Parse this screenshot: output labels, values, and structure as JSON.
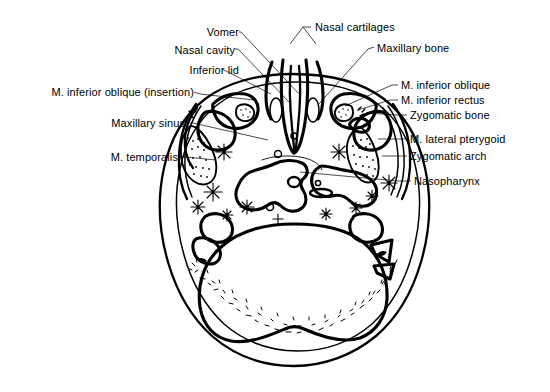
{
  "figure": {
    "background_color": "#ffffff",
    "line_color": "#000000",
    "width": 550,
    "height": 392
  },
  "labels": {
    "left": [
      {
        "id": "inferior-lid",
        "text": "Inferior lid"
      },
      {
        "id": "m-inferior-oblique-insertion",
        "text": "M. inferior oblique (insertion)"
      },
      {
        "id": "maxillary-sinus",
        "text": "Maxillary sinus"
      },
      {
        "id": "m-temporalis",
        "text": "M. temporalis"
      }
    ],
    "top": [
      {
        "id": "vomer",
        "text": "Vomer"
      },
      {
        "id": "nasal-cavity",
        "text": "Nasal cavity"
      },
      {
        "id": "nasal-cartilages",
        "text": "Nasal cartilages"
      }
    ],
    "right": [
      {
        "id": "maxillary-bone",
        "text": "Maxillary bone"
      },
      {
        "id": "m-inferior-oblique",
        "text": "M. inferior oblique"
      },
      {
        "id": "m-inferior-rectus",
        "text": "M. inferior rectus"
      },
      {
        "id": "zygomatic-bone",
        "text": "Zygomatic bone"
      },
      {
        "id": "m-lateral-pterygoid",
        "text": "M. lateral pterygoid"
      },
      {
        "id": "zygomatic-arch",
        "text": "Zygomatic arch"
      },
      {
        "id": "nasopharynx",
        "text": "Nasopharynx"
      }
    ]
  },
  "structures": {
    "names": [
      "skull-outer-contour",
      "scalp-layer",
      "cranial-base-bone",
      "nasal-septum-vomer",
      "nasal-cavity-airway",
      "maxillary-sinus-left",
      "maxillary-sinus-right",
      "temporalis-muscle",
      "lateral-pterygoid-muscle",
      "zygomatic-arch-left",
      "zygomatic-arch-right",
      "nasopharynx-airway",
      "occipital-bone",
      "cerebellum-region"
    ]
  }
}
